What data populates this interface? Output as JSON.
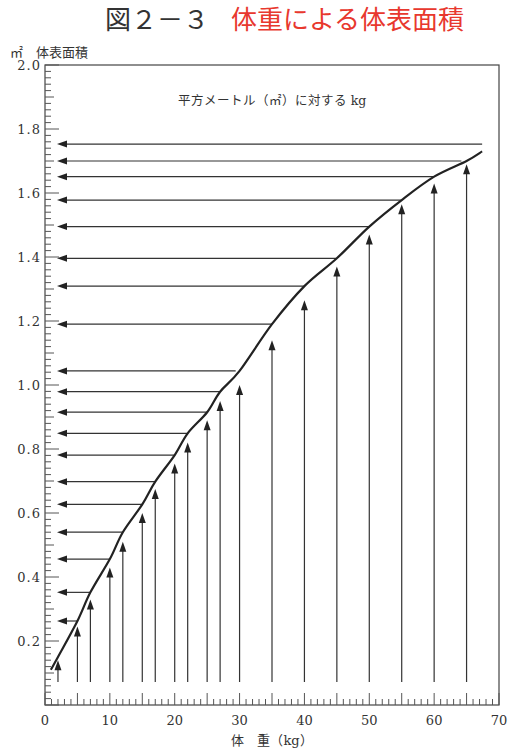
{
  "figure": {
    "number": "図２－３",
    "title": "体重による体表面積",
    "title_color": "#e8382e"
  },
  "chart_data": {
    "type": "line",
    "title": "体重による体表面積",
    "subtitle": "平方メートル（㎡）に対する kg",
    "xlabel": "体　重（kg）",
    "ylabel": "㎡　体表面積",
    "xlim": [
      0,
      70
    ],
    "ylim": [
      0,
      2.0
    ],
    "x_ticks": [
      0,
      10,
      20,
      30,
      40,
      50,
      60,
      70
    ],
    "y_ticks": [
      0.2,
      0.4,
      0.6,
      0.8,
      1.0,
      1.2,
      1.4,
      1.6,
      1.8,
      2.0
    ],
    "y_tick_labels": [
      "0.2",
      "0.4",
      "0.6",
      "0.8",
      "1.0",
      "1.2",
      "1.4",
      "1.6",
      "1.8",
      "2.0"
    ],
    "x_minor_step": 1,
    "y_minor_step": 0.02,
    "grid": false,
    "legend": "none",
    "curve": {
      "name": "体表面積",
      "x": [
        0.9,
        2,
        5,
        7,
        10,
        12,
        15,
        17,
        20,
        22,
        25,
        27,
        30,
        35,
        40,
        45,
        50,
        55,
        60,
        65,
        67.4
      ],
      "y": [
        0.11,
        0.15,
        0.2625,
        0.352,
        0.456,
        0.54,
        0.627,
        0.698,
        0.781,
        0.849,
        0.915,
        0.979,
        1.044,
        1.19,
        1.309,
        1.396,
        1.495,
        1.578,
        1.651,
        1.7,
        1.73
      ]
    },
    "reading_arrows": {
      "weights_kg": [
        2,
        5,
        7,
        10,
        12,
        15,
        17,
        20,
        22,
        25,
        27,
        30,
        35,
        40,
        45,
        50,
        55,
        60,
        65
      ],
      "arrow_tip_bsa": [
        0.14,
        0.245,
        0.33,
        0.43,
        0.51,
        0.6,
        0.675,
        0.755,
        0.82,
        0.89,
        0.95,
        1.0,
        1.14,
        1.265,
        1.37,
        1.47,
        1.565,
        1.63,
        1.69
      ],
      "horizontal_bsa": [
        0.2625,
        0.352,
        0.456,
        0.54,
        0.627,
        0.698,
        0.781,
        0.849,
        0.915,
        0.979,
        1.044,
        1.19,
        1.309,
        1.396,
        1.495,
        1.578,
        1.651,
        1.7,
        1.753
      ],
      "horizontal_end_kg": [
        5,
        7,
        10,
        12,
        15,
        17,
        20,
        22,
        25,
        27,
        29.4,
        35,
        40,
        45,
        50,
        55,
        60,
        64.2,
        67.4
      ]
    }
  }
}
